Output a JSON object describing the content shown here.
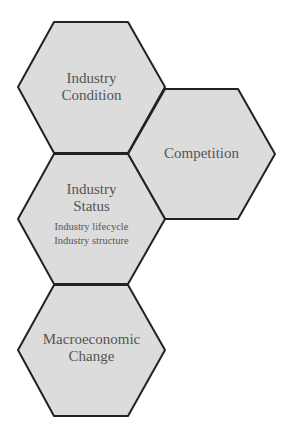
{
  "diagram": {
    "nodes": [
      {
        "id": "industry-condition",
        "title_lines": [
          "Industry",
          "Condition"
        ],
        "subitems": []
      },
      {
        "id": "competition",
        "title_lines": [
          "Competition"
        ],
        "subitems": []
      },
      {
        "id": "industry-status",
        "title_lines": [
          "Industry",
          "Status"
        ],
        "subitems": [
          "Industry lifecycle",
          "Industry structure"
        ]
      },
      {
        "id": "macroeconomic-change",
        "title_lines": [
          "Macroeconomic",
          "Change"
        ],
        "subitems": []
      }
    ],
    "colors": {
      "fill": "#dcdcdc",
      "stroke": "#222222",
      "text": "#555555"
    }
  }
}
